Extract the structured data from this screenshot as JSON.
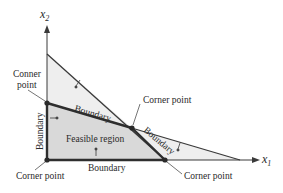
{
  "diagram": {
    "type": "linear-programming-feasible-region",
    "axes": {
      "x": {
        "label": "x",
        "subscript": "1"
      },
      "y": {
        "label": "x",
        "subscript": "2"
      }
    },
    "colors": {
      "line": "#3a3a3a",
      "boundary_thick": "#2e2e2e",
      "feasible_fill": "#d9d9d9",
      "outer_fill": "#eeeeee",
      "background": "#ffffff"
    },
    "labels": {
      "corner_top_left_line1": "Conner",
      "corner_top_left_line2": "point",
      "corner_middle": "Corner point",
      "corner_bottom_left": "Corner point",
      "corner_bottom_right": "Corner point",
      "boundary_upper": "Boundary",
      "boundary_right": "Boundary",
      "boundary_left": "Boundary",
      "boundary_bottom": "Boundary",
      "feasible_region": "Feasible region"
    }
  }
}
